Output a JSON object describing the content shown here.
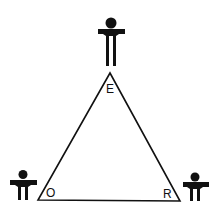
{
  "diagram": {
    "type": "triangle",
    "vertices": [
      {
        "id": "E",
        "label": "E",
        "position": "top"
      },
      {
        "id": "O",
        "label": "O",
        "position": "bottom-left"
      },
      {
        "id": "R",
        "label": "R",
        "position": "bottom-right"
      }
    ],
    "figures": [
      {
        "name": "person-top",
        "size": "large"
      },
      {
        "name": "person-bottom-left",
        "size": "small"
      },
      {
        "name": "person-bottom-right",
        "size": "small"
      }
    ],
    "colors": {
      "stroke": "#111111",
      "background": "#ffffff"
    }
  }
}
